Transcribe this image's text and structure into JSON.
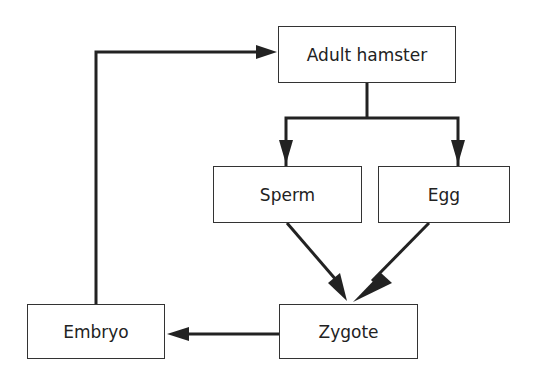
{
  "diagram": {
    "type": "life-cycle flowchart",
    "nodes": [
      {
        "id": "adult",
        "label": "Adult hamster"
      },
      {
        "id": "sperm",
        "label": "Sperm"
      },
      {
        "id": "egg",
        "label": "Egg"
      },
      {
        "id": "zygote",
        "label": "Zygote"
      },
      {
        "id": "embryo",
        "label": "Embryo"
      }
    ],
    "edges": [
      {
        "from": "adult",
        "to": "sperm"
      },
      {
        "from": "adult",
        "to": "egg"
      },
      {
        "from": "sperm",
        "to": "zygote"
      },
      {
        "from": "egg",
        "to": "zygote"
      },
      {
        "from": "zygote",
        "to": "embryo"
      },
      {
        "from": "embryo",
        "to": "adult"
      }
    ],
    "colors": {
      "line": "#222222",
      "box_border": "#333333",
      "background": "#ffffff"
    }
  }
}
